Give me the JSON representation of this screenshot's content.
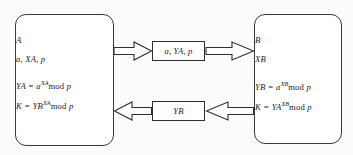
{
  "diagram": {
    "stroke_color": "#2f2f2f",
    "fill_color": "#ffffff",
    "background_color": "#fbfbfb"
  },
  "party_a": {
    "name": "A",
    "lines": [
      {
        "id": "label",
        "text": "A"
      },
      {
        "id": "params",
        "text": "a, XA, p"
      },
      {
        "id": "compute_ya",
        "base": "YA = a",
        "exponent": "XA",
        "tail_rom": "mod",
        "tail_var": "p"
      },
      {
        "id": "compute_k",
        "base": "K = YB",
        "exponent": "XA",
        "tail_rom": "mod",
        "tail_var": "p"
      }
    ]
  },
  "party_b": {
    "name": "B",
    "lines": [
      {
        "id": "label",
        "text": "B"
      },
      {
        "id": "params",
        "text": "XB"
      },
      {
        "id": "compute_yb",
        "base": "YB = a",
        "exponent": "XB",
        "tail_rom": "mod",
        "tail_var": "p"
      },
      {
        "id": "compute_k",
        "base": "K = YA",
        "exponent": "XB",
        "tail_rom": "mod",
        "tail_var": "p"
      }
    ]
  },
  "messages": {
    "top": {
      "id": "a-to-b-message",
      "text": "a, YA, p"
    },
    "bottom": {
      "id": "b-to-a-message",
      "text": "YB"
    }
  },
  "arrows": [
    {
      "id": "arrow-a-to-msg",
      "direction": "right",
      "from": "party_a",
      "to": "message_top"
    },
    {
      "id": "arrow-msg-to-b",
      "direction": "right",
      "from": "message_top",
      "to": "party_b"
    },
    {
      "id": "arrow-msg-to-a",
      "direction": "left",
      "from": "message_bottom",
      "to": "party_a"
    },
    {
      "id": "arrow-b-to-msg",
      "direction": "left",
      "from": "party_b",
      "to": "message_bottom"
    }
  ]
}
